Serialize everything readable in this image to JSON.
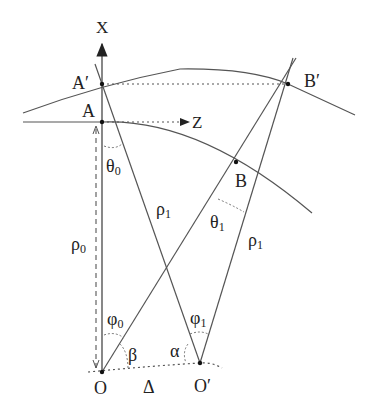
{
  "diagram": {
    "axes": {
      "x_label": "X",
      "z_label": "Z"
    },
    "points": {
      "A_prime": "A′",
      "A": "A",
      "B_prime": "B′",
      "B": "B",
      "O": "O",
      "O_prime": "O′"
    },
    "angles": {
      "theta0": "θ",
      "theta0_sub": "0",
      "theta1": "θ",
      "theta1_sub": "1",
      "phi0": "φ",
      "phi0_sub": "0",
      "phi1": "φ",
      "phi1_sub": "1",
      "beta": "β",
      "alpha": "α"
    },
    "lengths": {
      "rho0": "ρ",
      "rho0_sub": "0",
      "rho1_left": "ρ",
      "rho1_left_sub": "1",
      "rho1_right": "ρ",
      "rho1_right_sub": "1",
      "delta": "Δ"
    },
    "colors": {
      "line": "#555555",
      "text": "#222222"
    }
  }
}
